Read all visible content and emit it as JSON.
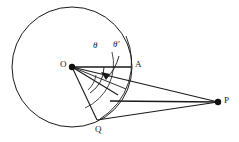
{
  "figure": {
    "type": "geometry-diagram",
    "background_color": "#ffffff",
    "stroke_color": "#1a1a1a",
    "label_color": "#1a1a1a"
  },
  "points": {
    "O": {
      "label": "O",
      "x": 72,
      "y": 67,
      "label_x": 60,
      "label_y": 62,
      "dot": true
    },
    "A": {
      "label": "A",
      "x": 131,
      "y": 67,
      "label_x": 135,
      "label_y": 62,
      "dot": false
    },
    "Q": {
      "label": "Q",
      "x": 97,
      "y": 120,
      "label_x": 95,
      "label_y": 126,
      "dot": false
    },
    "P": {
      "label": "P",
      "x": 218,
      "y": 102,
      "label_x": 224,
      "label_y": 97,
      "dot": true
    }
  },
  "circle": {
    "center_x": 72,
    "center_y": 67,
    "radius": 60
  },
  "angles": [
    {
      "name": "theta",
      "label": "θ",
      "label_x": 95,
      "label_y": 46
    },
    {
      "name": "theta-prime",
      "label": "θ′",
      "label_x": 114,
      "label_y": 45
    }
  ],
  "segments": [
    {
      "name": "O-to-A",
      "from": "O",
      "to": "A"
    },
    {
      "name": "O-to-P",
      "from": "O",
      "to": "P"
    },
    {
      "name": "O-to-Q",
      "from": "O",
      "to": "Q"
    },
    {
      "name": "Q-to-P",
      "from": "Q",
      "to": "P"
    },
    {
      "name": "O-to-interior-ray",
      "from": "O",
      "to": "interior"
    },
    {
      "name": "interior-to-P",
      "from": "interior",
      "to": "P"
    }
  ]
}
